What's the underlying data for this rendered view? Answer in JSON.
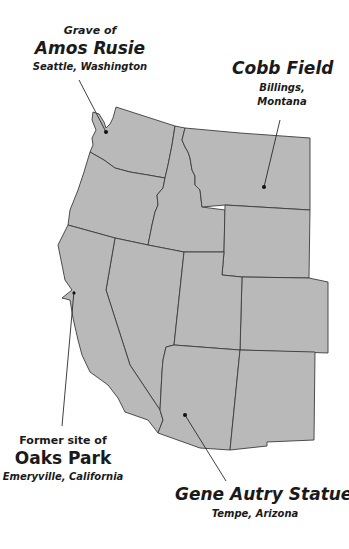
{
  "map": {
    "region": "Western United States",
    "fill_color": "#b9b9b9",
    "border_color": "#3c3c3c",
    "background": "#ffffff"
  },
  "landmarks": [
    {
      "prefix": "Grave of",
      "name": "Amos Rusie",
      "location": "Seattle, Washington",
      "marker": [
        106,
        132
      ]
    },
    {
      "prefix": "",
      "name": "Cobb Field",
      "location_line1": "Billings,",
      "location_line2": "Montana",
      "marker": [
        264,
        187
      ]
    },
    {
      "prefix": "Former site of",
      "name": "Oaks Park",
      "location": "Emeryville, California",
      "marker": [
        72,
        292
      ]
    },
    {
      "prefix": "",
      "name": "Gene Autry Statue",
      "location": "Tempe, Arizona",
      "marker": [
        185,
        415
      ]
    }
  ]
}
